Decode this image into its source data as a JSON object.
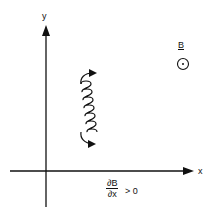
{
  "diagram": {
    "axes": {
      "y_label": "y",
      "x_label": "x"
    },
    "field": {
      "label": "B",
      "symbol": "out-of-page (dot in circle)"
    },
    "gradient_condition": {
      "numerator": "∂B",
      "denominator": "∂x",
      "relation": "> 0"
    },
    "trajectory": {
      "description": "helical particle drift along y with gyration loops",
      "loops": 7
    },
    "colors": {
      "ink": "#111111",
      "background": "#ffffff"
    }
  }
}
